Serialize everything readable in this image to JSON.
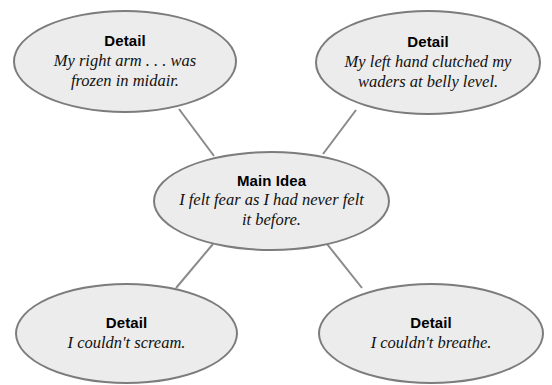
{
  "diagram": {
    "type": "main-idea-web",
    "background_color": "#ffffff",
    "node_fill_color": "#ececec",
    "node_stroke_color": "#7c7c7c",
    "connector_color": "#8a8a8a",
    "nodes": {
      "detail_top_left": {
        "heading": "Detail",
        "body": "My right arm . . . was\nfrozen in midair."
      },
      "detail_top_right": {
        "heading": "Detail",
        "body": "My left hand clutched my\nwaders at belly level."
      },
      "main_idea": {
        "heading": "Main Idea",
        "body": "I felt fear as I had never felt\nit before."
      },
      "detail_bottom_left": {
        "heading": "Detail",
        "body": "I couldn't scream."
      },
      "detail_bottom_right": {
        "heading": "Detail",
        "body": "I couldn't breathe."
      }
    }
  }
}
